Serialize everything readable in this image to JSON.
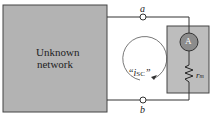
{
  "diagram": {
    "network_label_line1": "Unknown",
    "network_label_line2": "network",
    "terminal_a": "a",
    "terminal_b": "b",
    "current_label": "“i",
    "current_sub": "SC",
    "current_close": "”",
    "ammeter_symbol": "A",
    "resistor_label": "r",
    "resistor_sub": "m",
    "colors": {
      "network": "#b3b3b3",
      "meter_box": "#bdbdbd",
      "ammeter": "#8c8c8c",
      "wire": "#333333"
    }
  }
}
